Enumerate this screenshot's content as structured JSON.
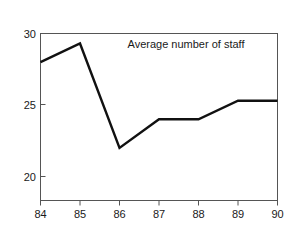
{
  "chart_data": {
    "type": "line",
    "title": "Average number of staff",
    "xlabel": "",
    "ylabel": "",
    "categories": [
      "84",
      "85",
      "86",
      "87",
      "88",
      "89",
      "90"
    ],
    "x": [
      84,
      85,
      86,
      87,
      88,
      89,
      90
    ],
    "values": [
      28.0,
      29.3,
      22.0,
      24.0,
      24.0,
      25.3,
      25.3
    ],
    "series": [
      {
        "name": "Average number of staff",
        "values": [
          28.0,
          29.3,
          22.0,
          24.0,
          24.0,
          25.3,
          25.3
        ],
        "color": "#111111"
      }
    ],
    "xlim": [
      84,
      90
    ],
    "ylim": [
      17.3,
      30
    ],
    "yticks": [
      20,
      25,
      30
    ],
    "ytick_labels": [
      "20",
      "25",
      "30"
    ],
    "xticks": [
      84,
      85,
      86,
      87,
      88,
      89,
      90
    ],
    "xtick_labels": [
      "84",
      "85",
      "86",
      "87",
      "88",
      "89",
      "90"
    ],
    "grid": false,
    "legend": "none",
    "title_position": "inside-top-right",
    "frame": "box",
    "background_color": "#ffffff",
    "axis_color": "#555555",
    "text_color": "#1a1a1a"
  }
}
